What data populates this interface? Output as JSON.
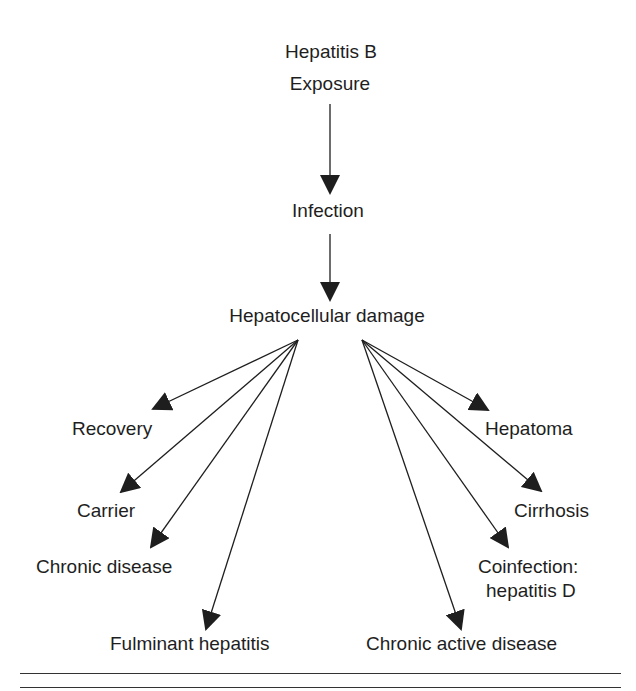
{
  "diagram": {
    "title": "Hepatitis B",
    "nodes": {
      "exposure": "Exposure",
      "infection": "Infection",
      "damage": "Hepatocellular damage",
      "recovery": "Recovery",
      "carrier": "Carrier",
      "chronic_disease": "Chronic disease",
      "fulminant": "Fulminant hepatitis",
      "hepatoma": "Hepatoma",
      "cirrhosis": "Cirrhosis",
      "coinfection_line1": "Coinfection:",
      "coinfection_line2": "hepatitis D",
      "chronic_active": "Chronic active disease"
    },
    "edges": [
      {
        "from": "Exposure",
        "to": "Infection"
      },
      {
        "from": "Infection",
        "to": "Hepatocellular damage"
      },
      {
        "from": "Hepatocellular damage",
        "to": "Recovery"
      },
      {
        "from": "Hepatocellular damage",
        "to": "Carrier"
      },
      {
        "from": "Hepatocellular damage",
        "to": "Chronic disease"
      },
      {
        "from": "Hepatocellular damage",
        "to": "Fulminant hepatitis"
      },
      {
        "from": "Hepatocellular damage",
        "to": "Hepatoma"
      },
      {
        "from": "Hepatocellular damage",
        "to": "Cirrhosis"
      },
      {
        "from": "Hepatocellular damage",
        "to": "Coinfection: hepatitis D"
      },
      {
        "from": "Hepatocellular damage",
        "to": "Chronic active disease"
      }
    ],
    "colors": {
      "ink": "#1e1e1e",
      "background": "#ffffff"
    }
  }
}
